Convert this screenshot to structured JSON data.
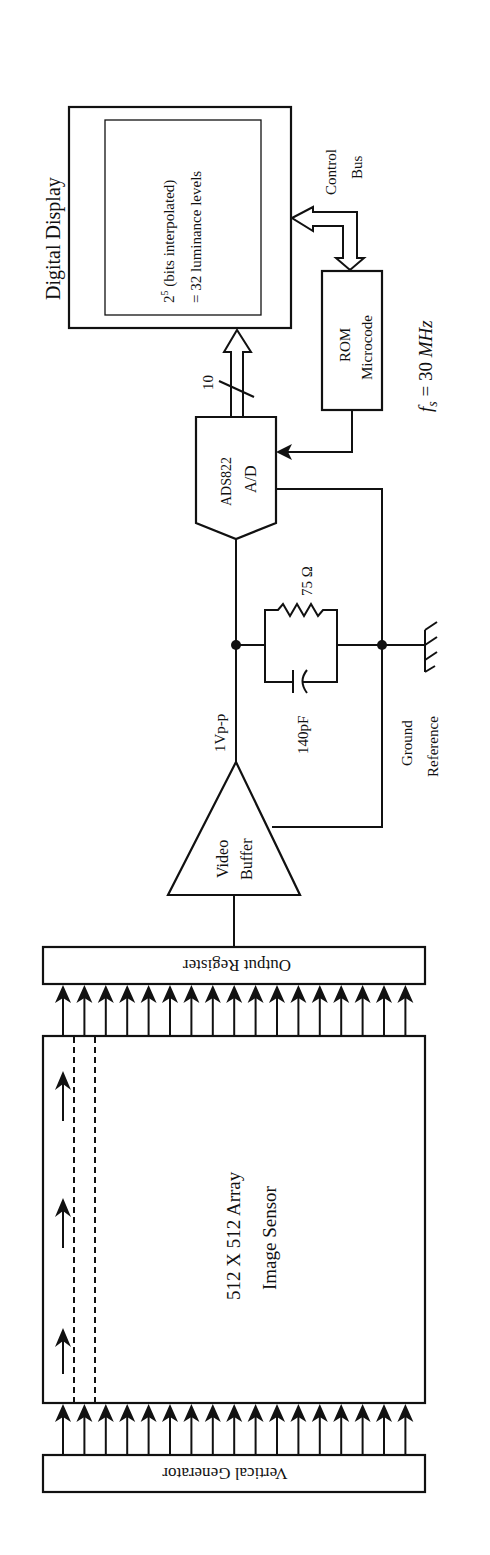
{
  "diagram": {
    "orientation": "rotated 90 degrees counter-clockwise",
    "colors": {
      "ink": "#111111",
      "background": "#ffffff"
    },
    "blocks": {
      "digital_display": {
        "title": "Digital Display",
        "inner_line1": "2",
        "inner_sup": "5",
        "inner_line1_rest": " (bits interpolated)",
        "inner_line2": "= 32 luminance levels"
      },
      "control_bus": {
        "line1": "Control",
        "line2": "Bus"
      },
      "rom": {
        "line1": "ROM",
        "line2": "Microcode"
      },
      "sample_rate": {
        "symbol": "f",
        "subscript": "s",
        "value": " = 30 ",
        "unit": "MHz"
      },
      "adc": {
        "line1": "ADS822",
        "line2": "A/D"
      },
      "bus_width": "10",
      "resistor": "75 Ω",
      "capacitor": "140pF",
      "signal_level": "1Vp-p",
      "ground": {
        "line1": "Ground",
        "line2": "Reference"
      },
      "video_buffer": {
        "line1": "Video",
        "line2": "Buffer"
      },
      "output_register": "Output Register",
      "image_sensor": {
        "line1": "512 X 512 Array",
        "line2": "Image Sensor"
      },
      "vertical_generator": "Vertical Generator"
    },
    "transfer_arrow_count": 17
  }
}
